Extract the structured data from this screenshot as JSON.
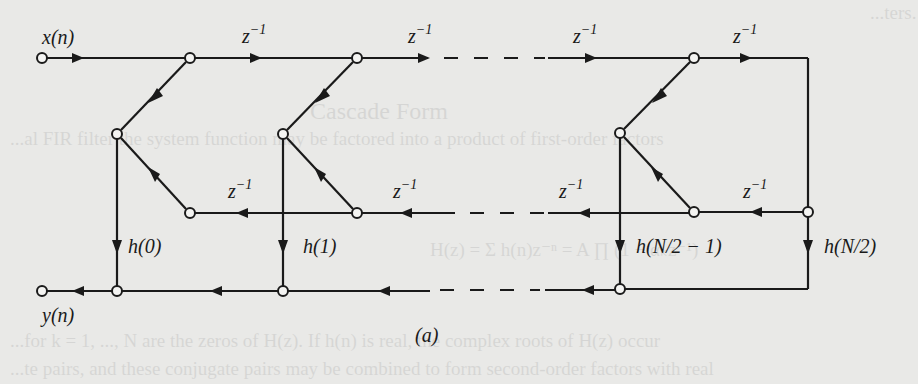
{
  "figure": {
    "caption": "(a)",
    "input_label": "x(n)",
    "output_label": "y(n)",
    "delay_label": "z",
    "delay_exponent": "−1",
    "coefficients": [
      "h(0)",
      "h(1)",
      "h(N/2 − 1)",
      "h(N/2)"
    ],
    "colors": {
      "line": "#1a1a1a",
      "background": "#e9e9e7",
      "node_fill": "#f4f4f2"
    }
  },
  "structure": {
    "type": "linear-phase FIR signal flow graph (folded delay line)",
    "top_delays": 4,
    "bottom_delays": 4,
    "taps_shown": 4,
    "ellipsis_rows": [
      "top",
      "middle",
      "bottom"
    ]
  },
  "background_text": [
    "...ters.",
    "Cascade Form",
    "...al FIR filter the system function may be factored into a product of first-order factors",
    "H(z) = Σ h(n)z⁻ⁿ = A ∏ (1 − αₖz⁻¹)",
    "...for k = 1, ..., N are the zeros of H(z). If h(n) is real, the complex roots of H(z) occur",
    "...te pairs, and these conjugate pairs may be combined to form second-order factors with real"
  ]
}
